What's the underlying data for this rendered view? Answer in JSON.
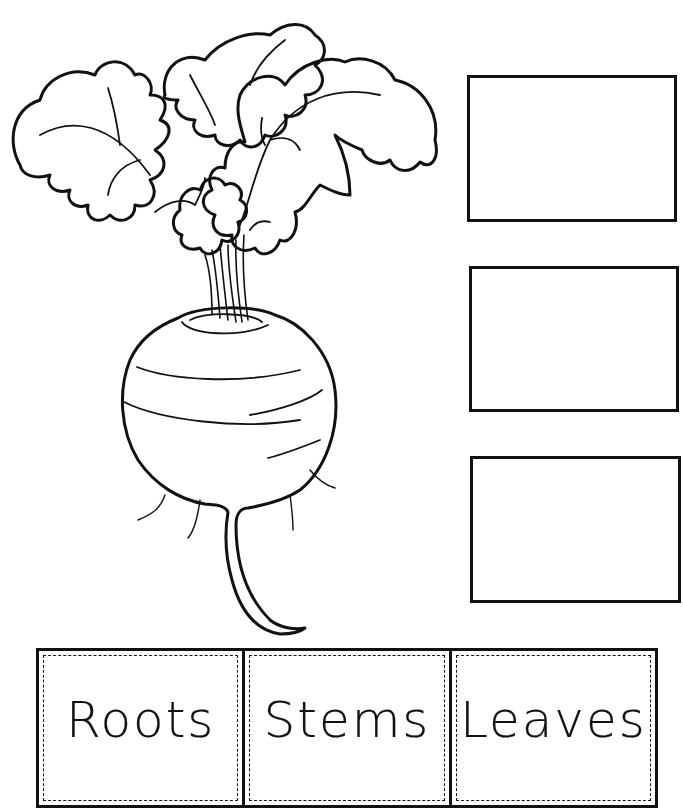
{
  "worksheet": {
    "illustration": "beet-plant-with-leaves-stems-and-root",
    "answer_boxes": [
      {
        "id": "box-top",
        "target": "leaves",
        "value": ""
      },
      {
        "id": "box-middle",
        "target": "stems",
        "value": ""
      },
      {
        "id": "box-bottom",
        "target": "roots",
        "value": ""
      }
    ],
    "cut_out_labels": [
      {
        "label": "Roots"
      },
      {
        "label": "Stems"
      },
      {
        "label": "Leaves"
      }
    ]
  }
}
